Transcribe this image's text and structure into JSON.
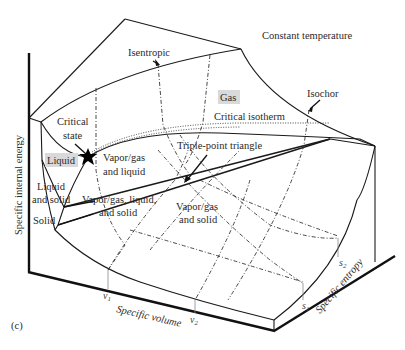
{
  "figure": {
    "panel_label": "(c)",
    "title_annotation": "Constant temperature",
    "axes": {
      "vertical": "Specific internal energy",
      "volume": "Specific volume",
      "entropy": "Specific entropy"
    },
    "ticks": {
      "v1": "v",
      "v1_sub": "1",
      "v2": "v",
      "v2_sub": "2",
      "s1": "s",
      "s1_sub": "1",
      "s2": "s",
      "s2_sub": "2"
    },
    "regions": {
      "gas": "Gas",
      "liquid": "Liquid",
      "solid": "Solid",
      "liquid_and_solid_line1": "Liquid",
      "liquid_and_solid_line2": "and solid",
      "vapor_liquid_line1": "Vapor/gas",
      "vapor_liquid_line2": "and liquid",
      "vapor_liquid_solid_line1": "Vapor/gas, liquid,",
      "vapor_liquid_solid_line2": "and solid",
      "vapor_solid_line1": "Vapor/gas",
      "vapor_solid_line2": "and solid"
    },
    "annotations": {
      "isentropic": "Isentropic",
      "isochor": "Isochor",
      "critical_isotherm": "Critical isotherm",
      "critical_state_line1": "Critical",
      "critical_state_line2": "state",
      "triple_point_triangle": "Triple-point triangle"
    },
    "colors": {
      "line": "#1a1a1a",
      "label_highlight": "#d9d9d9",
      "text": "#2a2a2a"
    }
  }
}
